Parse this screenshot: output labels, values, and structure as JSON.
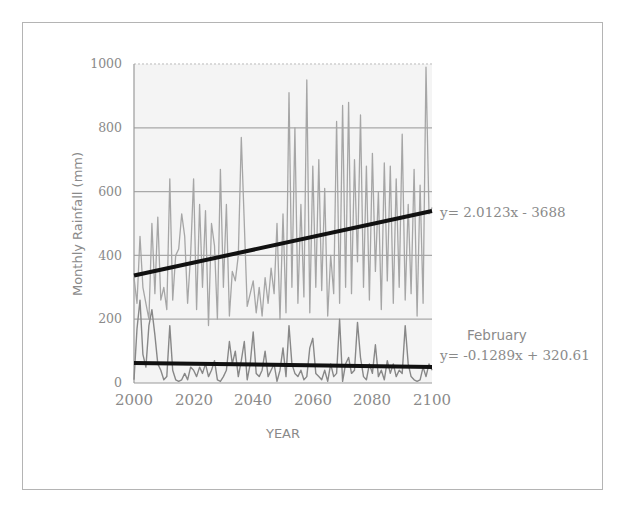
{
  "chart_data": {
    "type": "line",
    "title": "",
    "xlabel": "YEAR",
    "ylabel": "Monthly Rainfall (mm)",
    "xlim": [
      2000,
      2100
    ],
    "ylim": [
      0,
      1000
    ],
    "x_ticks": [
      "2000",
      "2020",
      "2040",
      "2060",
      "2080",
      "2100"
    ],
    "y_ticks": [
      "0",
      "200",
      "400",
      "600",
      "800",
      "1000"
    ],
    "grid": "horizontal",
    "legend": "none",
    "series": [
      {
        "name": "Monthly rainfall (wettest month)",
        "color": "#9a9a9a",
        "x": [
          2000,
          2001,
          2002,
          2003,
          2004,
          2005,
          2006,
          2007,
          2008,
          2009,
          2010,
          2011,
          2012,
          2013,
          2014,
          2015,
          2016,
          2017,
          2018,
          2019,
          2020,
          2021,
          2022,
          2023,
          2024,
          2025,
          2026,
          2027,
          2028,
          2029,
          2030,
          2031,
          2032,
          2033,
          2034,
          2035,
          2036,
          2037,
          2038,
          2039,
          2040,
          2041,
          2042,
          2043,
          2044,
          2045,
          2046,
          2047,
          2048,
          2049,
          2050,
          2051,
          2052,
          2053,
          2054,
          2055,
          2056,
          2057,
          2058,
          2059,
          2060,
          2061,
          2062,
          2063,
          2064,
          2065,
          2066,
          2067,
          2068,
          2069,
          2070,
          2071,
          2072,
          2073,
          2074,
          2075,
          2076,
          2077,
          2078,
          2079,
          2080,
          2081,
          2082,
          2083,
          2084,
          2085,
          2086,
          2087,
          2088,
          2089,
          2090,
          2091,
          2092,
          2093,
          2094,
          2095,
          2096,
          2097,
          2098,
          2099,
          2100
        ],
        "values": [
          330,
          250,
          460,
          300,
          250,
          200,
          500,
          280,
          520,
          260,
          300,
          230,
          640,
          260,
          400,
          420,
          530,
          460,
          250,
          400,
          640,
          230,
          560,
          300,
          540,
          180,
          500,
          430,
          200,
          670,
          300,
          560,
          210,
          350,
          320,
          400,
          770,
          500,
          240,
          280,
          320,
          220,
          300,
          210,
          330,
          250,
          360,
          280,
          500,
          200,
          530,
          220,
          910,
          300,
          800,
          250,
          560,
          270,
          950,
          220,
          680,
          300,
          700,
          290,
          610,
          210,
          400,
          280,
          820,
          250,
          870,
          300,
          880,
          280,
          700,
          380,
          840,
          300,
          680,
          260,
          720,
          350,
          600,
          230,
          690,
          320,
          680,
          250,
          640,
          300,
          780,
          260,
          560,
          280,
          670,
          210,
          620,
          250,
          990,
          530,
          550
        ],
        "trend": {
          "equation": "y= 2.0123x - 3688",
          "slope": 2.0123,
          "intercept": -3688,
          "start": [
            2000,
            337
          ],
          "end": [
            2100,
            539
          ]
        }
      },
      {
        "name": "February",
        "color": "#8a8a8a",
        "x": [
          2000,
          2001,
          2002,
          2003,
          2004,
          2005,
          2006,
          2007,
          2008,
          2009,
          2010,
          2011,
          2012,
          2013,
          2014,
          2015,
          2016,
          2017,
          2018,
          2019,
          2020,
          2021,
          2022,
          2023,
          2024,
          2025,
          2026,
          2027,
          2028,
          2029,
          2030,
          2031,
          2032,
          2033,
          2034,
          2035,
          2036,
          2037,
          2038,
          2039,
          2040,
          2041,
          2042,
          2043,
          2044,
          2045,
          2046,
          2047,
          2048,
          2049,
          2050,
          2051,
          2052,
          2053,
          2054,
          2055,
          2056,
          2057,
          2058,
          2059,
          2060,
          2061,
          2062,
          2063,
          2064,
          2065,
          2066,
          2067,
          2068,
          2069,
          2070,
          2071,
          2072,
          2073,
          2074,
          2075,
          2076,
          2077,
          2078,
          2079,
          2080,
          2081,
          2082,
          2083,
          2084,
          2085,
          2086,
          2087,
          2088,
          2089,
          2090,
          2091,
          2092,
          2093,
          2094,
          2095,
          2096,
          2097,
          2098,
          2099,
          2100
        ],
        "values": [
          10,
          170,
          260,
          90,
          50,
          180,
          230,
          150,
          60,
          40,
          10,
          20,
          180,
          40,
          10,
          5,
          10,
          30,
          10,
          50,
          40,
          20,
          50,
          30,
          60,
          20,
          40,
          70,
          10,
          5,
          20,
          40,
          130,
          60,
          100,
          20,
          70,
          130,
          10,
          60,
          160,
          30,
          20,
          40,
          100,
          20,
          40,
          60,
          5,
          40,
          110,
          20,
          180,
          60,
          30,
          20,
          40,
          10,
          20,
          110,
          140,
          30,
          20,
          10,
          40,
          5,
          60,
          20,
          30,
          200,
          5,
          60,
          80,
          30,
          40,
          190,
          80,
          20,
          10,
          60,
          30,
          120,
          20,
          40,
          10,
          70,
          30,
          60,
          20,
          40,
          30,
          180,
          60,
          20,
          10,
          5,
          10,
          50,
          20,
          60,
          40
        ],
        "trend": {
          "equation": "y= -0.1289x + 320.61",
          "slope": -0.1289,
          "intercept": 320.61,
          "start": [
            2000,
            63
          ],
          "end": [
            2100,
            50
          ]
        }
      }
    ],
    "annotations": [
      {
        "text": "y= 2.0123x - 3688",
        "position": "right of main trend line end"
      },
      {
        "text": "February",
        "position": "right, above February equation"
      },
      {
        "text": "y= -0.1289x + 320.61",
        "position": "right of February trend line end"
      }
    ]
  },
  "labels": {
    "ylabel": "Monthly Rainfall (mm)",
    "xlabel": "YEAR",
    "y_ticks": [
      "0",
      "200",
      "400",
      "600",
      "800",
      "1000"
    ],
    "x_ticks": [
      "2000",
      "2020",
      "2040",
      "2060",
      "2080",
      "2100"
    ],
    "eq_main": "y= 2.0123x - 3688",
    "feb_label": "February",
    "eq_feb": "y= -0.1289x + 320.61"
  }
}
